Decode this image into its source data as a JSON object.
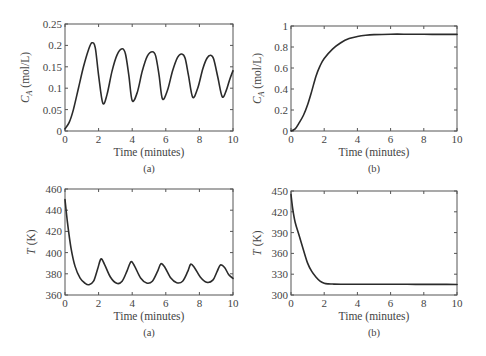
{
  "chart_data": [
    {
      "id": "ca_a",
      "type": "line",
      "caption": "(a)",
      "xlabel": "Time (minutes)",
      "ylabel_main": "C",
      "ylabel_sub": "A",
      "ylabel_rest": " (mol/L)",
      "xlim": [
        0,
        10
      ],
      "ylim": [
        0,
        0.25
      ],
      "xticks": [
        0,
        2,
        4,
        6,
        8,
        10
      ],
      "yticks": [
        0,
        0.05,
        0.1,
        0.15,
        0.2,
        0.25
      ],
      "ytick_labels": [
        "0",
        "0.05",
        "0.1",
        "0.15",
        "0.2",
        "0.25"
      ],
      "grid": false,
      "box": {
        "x0": 65,
        "y0": 24,
        "x1": 233,
        "y1": 131
      },
      "series": [
        {
          "name": "CA",
          "x": [
            0,
            0.25,
            0.5,
            0.8,
            1.1,
            1.4,
            1.6,
            1.8,
            2.0,
            2.25,
            2.5,
            2.8,
            3.1,
            3.4,
            3.6,
            3.8,
            4.0,
            4.3,
            4.6,
            4.9,
            5.2,
            5.4,
            5.6,
            5.8,
            6.1,
            6.4,
            6.7,
            6.95,
            7.15,
            7.35,
            7.6,
            7.9,
            8.2,
            8.45,
            8.67,
            8.85,
            9.1,
            9.36,
            9.6,
            9.8,
            10.0
          ],
          "y": [
            0.005,
            0.02,
            0.05,
            0.1,
            0.15,
            0.19,
            0.206,
            0.195,
            0.13,
            0.065,
            0.085,
            0.14,
            0.178,
            0.192,
            0.18,
            0.13,
            0.071,
            0.09,
            0.14,
            0.175,
            0.185,
            0.175,
            0.13,
            0.075,
            0.095,
            0.14,
            0.172,
            0.18,
            0.17,
            0.13,
            0.079,
            0.1,
            0.145,
            0.17,
            0.177,
            0.168,
            0.125,
            0.08,
            0.095,
            0.12,
            0.141
          ]
        }
      ]
    },
    {
      "id": "ca_b",
      "type": "line",
      "caption": "(b)",
      "xlabel": "Time (minutes)",
      "ylabel_main": "C",
      "ylabel_sub": "A",
      "ylabel_rest": " (mol/L)",
      "xlim": [
        0,
        10
      ],
      "ylim": [
        0,
        1
      ],
      "xticks": [
        0,
        2,
        4,
        6,
        8,
        10
      ],
      "yticks": [
        0,
        0.2,
        0.4,
        0.6,
        0.8,
        1
      ],
      "ytick_labels": [
        "0",
        "0.2",
        "0.4",
        "0.6",
        "0.8",
        "1"
      ],
      "grid": false,
      "box": {
        "x0": 291,
        "y0": 26,
        "x1": 457,
        "y1": 131
      },
      "series": [
        {
          "name": "CA",
          "x": [
            0,
            0.25,
            0.5,
            0.75,
            1.0,
            1.25,
            1.5,
            1.75,
            2.0,
            2.5,
            3.0,
            3.5,
            4.0,
            4.5,
            5.0,
            6.0,
            7.0,
            8.0,
            9.0,
            10.0
          ],
          "y": [
            0.0,
            0.02,
            0.08,
            0.15,
            0.25,
            0.38,
            0.52,
            0.62,
            0.69,
            0.78,
            0.84,
            0.88,
            0.9,
            0.912,
            0.918,
            0.922,
            0.922,
            0.921,
            0.92,
            0.92
          ]
        }
      ]
    },
    {
      "id": "t_a",
      "type": "line",
      "caption": "(a)",
      "xlabel": "Time (minutes)",
      "ylabel_main": "T",
      "ylabel_sub": "",
      "ylabel_rest": " (K)",
      "xlim": [
        0,
        10
      ],
      "ylim": [
        360,
        460
      ],
      "xticks": [
        0,
        2,
        4,
        6,
        8,
        10
      ],
      "yticks": [
        360,
        380,
        400,
        420,
        440,
        460
      ],
      "ytick_labels": [
        "360",
        "380",
        "400",
        "420",
        "440",
        "460"
      ],
      "grid": false,
      "box": {
        "x0": 65,
        "y0": 189,
        "x1": 233,
        "y1": 295
      },
      "series": [
        {
          "name": "T",
          "x": [
            0,
            0.15,
            0.35,
            0.6,
            0.9,
            1.2,
            1.43,
            1.7,
            1.95,
            2.14,
            2.35,
            2.7,
            3.08,
            3.4,
            3.7,
            3.93,
            4.15,
            4.5,
            4.86,
            5.2,
            5.5,
            5.71,
            5.95,
            6.3,
            6.65,
            7.0,
            7.3,
            7.48,
            7.7,
            8.05,
            8.43,
            8.8,
            9.05,
            9.25,
            9.5,
            9.75,
            10.0
          ],
          "y": [
            450,
            428,
            405,
            387,
            376,
            371,
            369.7,
            373,
            385,
            394,
            389,
            377,
            371,
            373,
            383,
            391.4,
            387,
            376,
            371.3,
            373,
            382,
            389.5,
            386,
            376,
            371.6,
            373,
            382,
            389,
            386,
            377,
            372,
            374,
            382,
            388.3,
            386,
            379,
            375.7
          ]
        }
      ]
    },
    {
      "id": "t_b",
      "type": "line",
      "caption": "(b)",
      "xlabel": "Time (minutes)",
      "ylabel_main": "T",
      "ylabel_sub": "",
      "ylabel_rest": " (K)",
      "xlim": [
        0,
        10
      ],
      "ylim": [
        300,
        450
      ],
      "xticks": [
        0,
        2,
        4,
        6,
        8,
        10
      ],
      "yticks": [
        300,
        330,
        360,
        390,
        420,
        450
      ],
      "ytick_labels": [
        "300",
        "330",
        "360",
        "390",
        "420",
        "450"
      ],
      "grid": false,
      "box": {
        "x0": 291,
        "y0": 191,
        "x1": 457,
        "y1": 295
      },
      "series": [
        {
          "name": "T",
          "x": [
            0,
            0.1,
            0.25,
            0.5,
            0.75,
            1.0,
            1.25,
            1.5,
            1.75,
            2.0,
            2.25,
            2.5,
            3.0,
            4.0,
            5.0,
            6.0,
            7.0,
            8.0,
            9.0,
            10.0
          ],
          "y": [
            445,
            425,
            405,
            385,
            365,
            346,
            334,
            326,
            320,
            317,
            316,
            315.8,
            315.6,
            315.5,
            315.5,
            315.4,
            315.4,
            315.3,
            315.3,
            315.2
          ]
        }
      ]
    }
  ]
}
